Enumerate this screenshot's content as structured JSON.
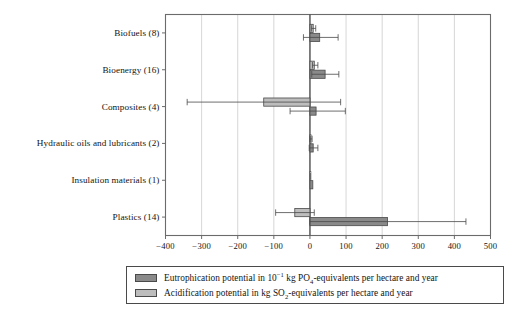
{
  "chart_data": {
    "type": "bar",
    "orientation": "horizontal",
    "title": "",
    "xlabel": "",
    "ylabel": "",
    "xlim": [
      -400,
      500
    ],
    "xticks": [
      -400,
      -300,
      -200,
      -100,
      0,
      100,
      200,
      300,
      400,
      500
    ],
    "xticklabels": [
      "−400",
      "−300",
      "−200",
      "−100",
      "0",
      "100",
      "200",
      "300",
      "400",
      "500"
    ],
    "grid": "vertical",
    "legend_position": "below-axes",
    "categories": [
      "Biofuels (8)",
      "Bioenergy (16)",
      "Composites (4)",
      "Hydraulic oils and lubricants (2)",
      "Insulation materials (1)",
      "Plastics (14)"
    ],
    "series": [
      {
        "name": "Eutrophication potential in 10−1 kg PO4-equivalents per hectare and year",
        "color": "#8a8a8a",
        "values": [
          27,
          42,
          17,
          9,
          8,
          215
        ],
        "err_low": [
          -18,
          5,
          -55,
          -2,
          8,
          0
        ],
        "err_high": [
          78,
          80,
          98,
          22,
          8,
          432
        ]
      },
      {
        "name": "Acidification potential in kg SO2-equivalents per hectare and year",
        "color": "#bdbdbd",
        "values": [
          9,
          12,
          -128,
          3,
          2,
          -42
        ],
        "err_low": [
          4,
          7,
          -340,
          0,
          2,
          -95
        ],
        "err_high": [
          16,
          22,
          85,
          6,
          2,
          12
        ]
      }
    ]
  },
  "legend": {
    "entries": [
      {
        "swatch": "#8a8a8a",
        "prefix": "Eutrophication potential in 10",
        "sup": "−1",
        "mid": " kg PO",
        "sub": "4",
        "suffix": "-equivalents per hectare and year"
      },
      {
        "swatch": "#bdbdbd",
        "prefix": "Acidification potential in kg SO",
        "sup": "",
        "mid": "",
        "sub": "2",
        "suffix": "-equivalents per hectare and year"
      }
    ]
  },
  "axes": {
    "frame_color": "#6b6b6b",
    "grid_color": "#cccccc",
    "zero_line_color": "#4a4a4a"
  }
}
